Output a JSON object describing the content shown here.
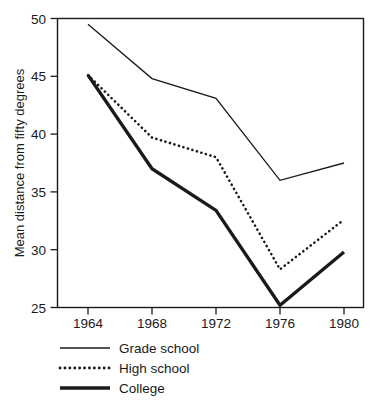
{
  "chart_data": {
    "type": "line",
    "title": "",
    "xlabel": "",
    "ylabel": "Mean distance from fifty degrees",
    "categories": [
      "1964",
      "1968",
      "1972",
      "1976",
      "1980"
    ],
    "x": [
      1964,
      1968,
      1972,
      1976,
      1980
    ],
    "xlim": [
      1962,
      1982
    ],
    "ylim": [
      25,
      50
    ],
    "yticks": [
      "25",
      "30",
      "35",
      "40",
      "45",
      "50"
    ],
    "ytick_values": [
      25,
      30,
      35,
      40,
      45,
      50
    ],
    "grid": false,
    "legend_position": "below-left",
    "series": [
      {
        "name": "Grade school",
        "style": "solid-thin",
        "values": [
          49.5,
          44.8,
          43.1,
          36.0,
          37.5
        ]
      },
      {
        "name": "High school",
        "style": "dotted",
        "values": [
          45.1,
          39.7,
          38.0,
          28.3,
          32.6
        ]
      },
      {
        "name": "College",
        "style": "solid-thick",
        "values": [
          45.1,
          37.0,
          33.4,
          25.2,
          29.8
        ]
      }
    ]
  },
  "legend": {
    "items": [
      {
        "label": "Grade school",
        "swatch": "thin-solid-line-icon"
      },
      {
        "label": "High school",
        "swatch": "dotted-line-icon"
      },
      {
        "label": "College",
        "swatch": "thick-solid-line-icon"
      }
    ]
  },
  "axes": {
    "y_title": "Mean distance from fifty degrees",
    "y_tick_labels": [
      "50",
      "45",
      "40",
      "35",
      "30",
      "25"
    ],
    "x_tick_labels": [
      "1964",
      "1968",
      "1972",
      "1976",
      "1980"
    ]
  },
  "colors": {
    "ink": "#1a1a1a",
    "background": "#ffffff"
  }
}
